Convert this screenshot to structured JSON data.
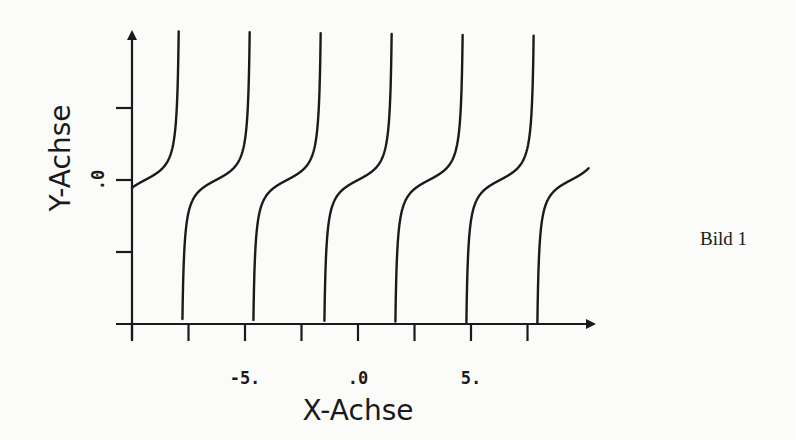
{
  "chart_data": {
    "type": "line",
    "function": "y = tan(x)",
    "title": "",
    "caption": "Bild 1",
    "xlabel": "X-Achse",
    "ylabel": "Y-Achse",
    "xlim": [
      -10,
      10.2
    ],
    "ylim": [
      -12,
      12.5
    ],
    "x_tick_labels": [
      {
        "value": -5,
        "label": "-5."
      },
      {
        "value": 0,
        "label": ".0"
      },
      {
        "value": 5,
        "label": "5."
      }
    ],
    "x_ticks": [
      -10,
      -7.5,
      -5,
      -2.5,
      0,
      2.5,
      5,
      7.5
    ],
    "y_tick_labels": [
      {
        "value": 0,
        "label": ".0"
      }
    ],
    "y_ticks": [
      -6,
      0,
      6
    ],
    "asymptotes": [
      -7.854,
      -4.712,
      -1.571,
      1.571,
      4.712,
      7.854
    ],
    "grid": false,
    "legend": null,
    "color": "#1a1a1a"
  }
}
